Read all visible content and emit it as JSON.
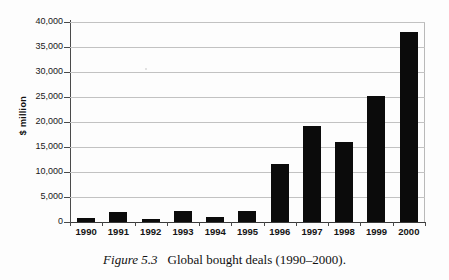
{
  "chart_data": {
    "type": "bar",
    "title": "",
    "xlabel": "",
    "ylabel": "$ million",
    "ylim": [
      0,
      40000
    ],
    "ytick_step": 5000,
    "grid": true,
    "legend": "none",
    "bar_color": "#0b0b0b",
    "categories": [
      "1990",
      "1991",
      "1992",
      "1993",
      "1994",
      "1995",
      "1996",
      "1997",
      "1998",
      "1999",
      "2000"
    ],
    "values": [
      800,
      2000,
      700,
      2200,
      1000,
      2200,
      11600,
      19300,
      16000,
      25300,
      38000
    ],
    "ytick_labels": [
      "0",
      "5,000",
      "10,000",
      "15,000",
      "20,000",
      "25,000",
      "30,000",
      "35,000",
      "40,000"
    ],
    "ytick_values": [
      0,
      5000,
      10000,
      15000,
      20000,
      25000,
      30000,
      35000,
      40000
    ]
  },
  "caption": {
    "figure_number": "Figure 5.3",
    "text": "Global bought deals (1990–2000)."
  }
}
